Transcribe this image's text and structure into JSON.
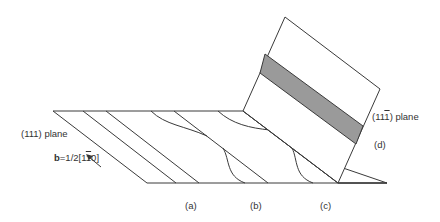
{
  "figure": {
    "labels": {
      "plane_111": "(111) plane",
      "plane_11m1_prefix": "(11",
      "plane_11m1_bar": "1",
      "plane_11m1_suffix": ") plane",
      "burgers_b": "b",
      "burgers_prefix": "=1/2[1",
      "burgers_bar": "1",
      "burgers_suffix": "0]",
      "a": "(a)",
      "b": "(b)",
      "c": "(c)",
      "d": "(d)"
    },
    "colors": {
      "line": "#3a3a3a",
      "shade": "#9a9a9a",
      "background": "#ffffff"
    }
  }
}
